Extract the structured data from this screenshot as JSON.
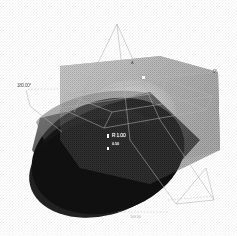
{
  "figure": {
    "background_color": "#ffffff",
    "render_style": "dithered halftone grayscale bitmap"
  },
  "palette": {
    "background": "#ffffff",
    "box_front_face": "#a8a8a8",
    "box_top_face": "#c9c9c9",
    "box_right_face": "#9a9a9a",
    "box_highlight_face": "#d8d8d8",
    "cylinder_dark_face": "#121212",
    "cylinder_mid_shade": "#4a4a4a",
    "wireframe_line": "#b4b4b4",
    "dashed_leader": "#bdbdbd",
    "marker_white": "#ffffff",
    "annotation_text": "#2a2a2a"
  },
  "annotations": {
    "left_label": "180.00°",
    "right_label": "0°",
    "face_label": "R 1.00",
    "face_sublabel": "0.50",
    "bottom_label": "100.00",
    "apex_label": "A"
  },
  "geometry": {
    "solid_type": "cuboid with cylindrical end",
    "wireframe_visible": true,
    "apex_triangle": true,
    "dashed_leaders": 3,
    "markers": 3
  }
}
